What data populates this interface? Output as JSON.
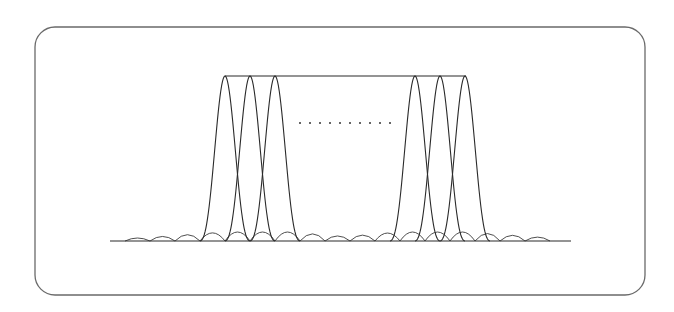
{
  "diagram": {
    "title": "",
    "frame": {
      "x": 35,
      "y": 27,
      "width": 610,
      "height": 268,
      "radius": 20,
      "stroke": "#6a6a6a"
    },
    "baseline": {
      "x1": 110,
      "x2": 571,
      "y": 241
    },
    "envelope_top": {
      "x1": 225,
      "x2": 466,
      "y": 76
    },
    "subcarriers_left": [
      225,
      250,
      275
    ],
    "subcarriers_right": [
      415,
      440,
      465
    ],
    "spacing": 25,
    "ellipsis": {
      "x_start": 300,
      "x_end": 390,
      "y": 123,
      "count": 10
    },
    "colors": {
      "line": "#2a2a2a",
      "frame": "#6a6a6a",
      "background": "#ffffff"
    }
  }
}
